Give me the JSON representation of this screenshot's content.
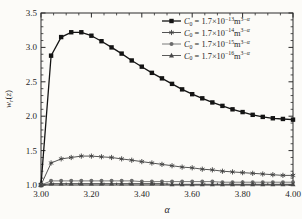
{
  "figure": {
    "background": "#fcfbf8",
    "axis_color": "#2a2a2a",
    "text_color": "#1f1f1f"
  },
  "chart_data": {
    "type": "line",
    "title": "",
    "xlabel": "α",
    "ylabel": "wᵣ(z)",
    "ylabel_parts": {
      "var": "w",
      "sub": "r",
      "open": "(",
      "arg": "z",
      "close": ")"
    },
    "xlim": [
      3.0,
      4.0
    ],
    "ylim": [
      1.0,
      3.5
    ],
    "grid": false,
    "legend_position": "top-right",
    "x_ticks": {
      "values": [
        3.0,
        3.2,
        3.4,
        3.6,
        3.8,
        4.0
      ],
      "labels": [
        "3.00",
        "3.20",
        "3.40",
        "3.60",
        "3.80",
        "4.00"
      ],
      "minor_step": 0.05
    },
    "y_ticks": {
      "values": [
        1.0,
        1.5,
        2.0,
        2.5,
        3.0,
        3.5
      ],
      "labels": [
        "1.0",
        "1.5",
        "2.0",
        "2.5",
        "3.0",
        "3.5"
      ],
      "minor_step": 0.1
    },
    "x": [
      3.0,
      3.04,
      3.08,
      3.12,
      3.16,
      3.2,
      3.24,
      3.28,
      3.32,
      3.36,
      3.4,
      3.44,
      3.48,
      3.52,
      3.56,
      3.6,
      3.64,
      3.68,
      3.72,
      3.76,
      3.8,
      3.84,
      3.88,
      3.92,
      3.96,
      4.0
    ],
    "series": [
      {
        "name": "C₀ = 1.7×10⁻¹³ m³⁻ᵅ",
        "marker": "square",
        "color": "#141414",
        "line_width": 1.3,
        "values": [
          1.0,
          2.88,
          3.15,
          3.22,
          3.22,
          3.17,
          3.09,
          3.0,
          2.91,
          2.81,
          2.72,
          2.63,
          2.55,
          2.47,
          2.39,
          2.32,
          2.26,
          2.2,
          2.15,
          2.1,
          2.06,
          2.02,
          1.99,
          1.97,
          1.96,
          1.95
        ]
      },
      {
        "name": "C₀ = 1.7×10⁻¹⁴ m³⁻ᵅ",
        "marker": "star",
        "color": "#404040",
        "line_width": 0.9,
        "values": [
          1.0,
          1.32,
          1.38,
          1.4,
          1.42,
          1.42,
          1.41,
          1.4,
          1.38,
          1.36,
          1.34,
          1.32,
          1.3,
          1.28,
          1.26,
          1.25,
          1.23,
          1.22,
          1.2,
          1.19,
          1.18,
          1.17,
          1.16,
          1.15,
          1.14,
          1.14
        ]
      },
      {
        "name": "C₀ = 1.7×10⁻¹⁵ m³⁻ᵅ",
        "marker": "circle",
        "color": "#6b6b6b",
        "line_width": 0.9,
        "values": [
          1.0,
          1.06,
          1.06,
          1.06,
          1.06,
          1.06,
          1.06,
          1.06,
          1.06,
          1.06,
          1.05,
          1.05,
          1.05,
          1.05,
          1.05,
          1.05,
          1.05,
          1.05,
          1.04,
          1.04,
          1.04,
          1.04,
          1.04,
          1.04,
          1.04,
          1.04
        ]
      },
      {
        "name": "C₀ = 1.7×10⁻¹⁶ m³⁻ᵅ",
        "marker": "triangle",
        "color": "#474747",
        "line_width": 0.9,
        "values": [
          1.0,
          1.02,
          1.02,
          1.02,
          1.02,
          1.02,
          1.02,
          1.02,
          1.02,
          1.02,
          1.02,
          1.02,
          1.02,
          1.01,
          1.01,
          1.01,
          1.01,
          1.01,
          1.01,
          1.01,
          1.01,
          1.01,
          1.01,
          1.01,
          1.01,
          1.01
        ]
      }
    ],
    "legend_items": [
      {
        "var": "C",
        "sub": "0",
        "eq": " = 1.7×10",
        "exp": "−13",
        "unit": "m",
        "unit_exp_num": "3−",
        "unit_exp_var": "α"
      },
      {
        "var": "C",
        "sub": "0",
        "eq": " = 1.7×10",
        "exp": "−14",
        "unit": "m",
        "unit_exp_num": "3−",
        "unit_exp_var": "α"
      },
      {
        "var": "C",
        "sub": "0",
        "eq": " = 1.7×10",
        "exp": "−15",
        "unit": "m",
        "unit_exp_num": "3−",
        "unit_exp_var": "α"
      },
      {
        "var": "C",
        "sub": "0",
        "eq": " = 1.7×10",
        "exp": "−16",
        "unit": "m",
        "unit_exp_num": "3−",
        "unit_exp_var": "α"
      }
    ]
  }
}
